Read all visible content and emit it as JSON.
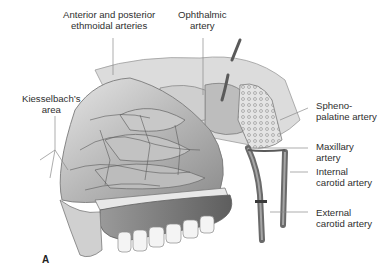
{
  "figure": {
    "panel_letter": "A",
    "labels": [
      {
        "id": "ethmoidal",
        "line1": "Anterior and posterior",
        "line2": "ethmoidal arteries"
      },
      {
        "id": "ophthalmic",
        "line1": "Ophthalmic",
        "line2": "artery"
      },
      {
        "id": "kiesselbach",
        "line1": "Kiesselbach’s",
        "line2": "area"
      },
      {
        "id": "sphenopalatine",
        "line1": "Spheno-",
        "line2": "palatine artery"
      },
      {
        "id": "maxillary",
        "line1": "Maxillary",
        "line2": "artery"
      },
      {
        "id": "internal-carotid",
        "line1": "Internal",
        "line2": "carotid artery"
      },
      {
        "id": "external-carotid",
        "line1": "External",
        "line2": "carotid artery"
      }
    ],
    "colors": {
      "background": "#ffffff",
      "text": "#2f2f2f",
      "leader_line": "#8a8a8a",
      "tissue_light": "#d9d9d9",
      "tissue_mid": "#a9a9a9",
      "tissue_dark": "#6e6e6e",
      "vessel": "#5a5a5a"
    }
  }
}
